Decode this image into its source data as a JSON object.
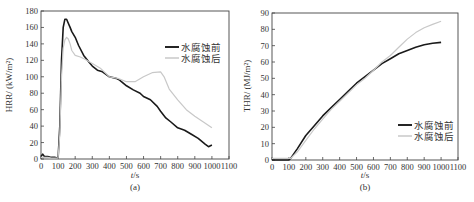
{
  "chart_data": [
    {
      "type": "line",
      "panel_label": "(a)",
      "title": "",
      "xlabel": "t/s",
      "ylabel": "HRR/ (kW/m²)",
      "xlim": [
        0,
        1100
      ],
      "ylim": [
        0,
        180
      ],
      "xticks": [
        0,
        100,
        200,
        300,
        400,
        500,
        600,
        700,
        800,
        900,
        1000,
        1100
      ],
      "yticks": [
        0,
        20,
        40,
        60,
        80,
        100,
        120,
        140,
        160,
        180
      ],
      "grid": false,
      "legend_position": "upper right",
      "series": [
        {
          "name": "水腐蚀前",
          "color": "#1a1a1a",
          "width": 1.6,
          "x": [
            0,
            10,
            20,
            40,
            60,
            80,
            100,
            110,
            120,
            130,
            140,
            150,
            160,
            170,
            180,
            200,
            220,
            250,
            280,
            300,
            330,
            360,
            400,
            440,
            460,
            500,
            540,
            580,
            600,
            640,
            680,
            700,
            730,
            760,
            800,
            840,
            880,
            920,
            960,
            980,
            1000
          ],
          "y": [
            3,
            6,
            3,
            3,
            2,
            2,
            1,
            40,
            120,
            160,
            170,
            170,
            165,
            160,
            155,
            148,
            138,
            126,
            118,
            113,
            108,
            106,
            100,
            98,
            96,
            89,
            84,
            80,
            76,
            72,
            64,
            58,
            50,
            45,
            38,
            35,
            30,
            25,
            18,
            15,
            17
          ]
        },
        {
          "name": "水腐蚀后",
          "color": "#c8c8c8",
          "width": 1.2,
          "x": [
            0,
            20,
            40,
            60,
            80,
            100,
            110,
            120,
            130,
            140,
            150,
            160,
            170,
            180,
            200,
            230,
            260,
            300,
            350,
            400,
            450,
            500,
            550,
            600,
            650,
            700,
            720,
            750,
            800,
            850,
            900,
            950,
            1000
          ],
          "y": [
            2,
            2,
            2,
            1,
            1,
            1,
            30,
            100,
            135,
            145,
            148,
            146,
            140,
            132,
            126,
            124,
            121,
            116,
            110,
            100,
            98,
            94,
            94,
            100,
            105,
            106,
            100,
            85,
            72,
            60,
            52,
            45,
            38
          ]
        }
      ]
    },
    {
      "type": "line",
      "panel_label": "(b)",
      "title": "",
      "xlabel": "t/s",
      "ylabel": "THR/ (MJ/m²)",
      "xlim": [
        0,
        1100
      ],
      "ylim": [
        0,
        90
      ],
      "xticks": [
        0,
        100,
        200,
        300,
        400,
        500,
        600,
        700,
        800,
        900,
        1000,
        1100
      ],
      "yticks": [
        0,
        10,
        20,
        30,
        40,
        50,
        60,
        70,
        80,
        90
      ],
      "grid": false,
      "legend_position": "lower right",
      "series": [
        {
          "name": "水腐蚀前",
          "color": "#1a1a1a",
          "width": 1.6,
          "x": [
            0,
            50,
            100,
            110,
            150,
            200,
            250,
            300,
            350,
            400,
            450,
            500,
            550,
            600,
            650,
            700,
            750,
            800,
            850,
            900,
            950,
            1000
          ],
          "y": [
            0,
            0,
            0,
            1,
            7,
            15,
            21,
            27,
            32,
            37,
            42,
            47,
            51,
            55,
            59,
            62,
            65,
            67,
            69,
            70.5,
            71.5,
            72
          ]
        },
        {
          "name": "水腐蚀后",
          "color": "#c8c8c8",
          "width": 1.2,
          "x": [
            0,
            50,
            100,
            110,
            150,
            200,
            250,
            300,
            350,
            400,
            450,
            500,
            550,
            600,
            650,
            700,
            750,
            800,
            850,
            900,
            950,
            1000
          ],
          "y": [
            1,
            1,
            1,
            1,
            5,
            12,
            19,
            25,
            31,
            36,
            41,
            46,
            50,
            55,
            60,
            64,
            69,
            74,
            78,
            81,
            83,
            85
          ]
        }
      ]
    }
  ]
}
